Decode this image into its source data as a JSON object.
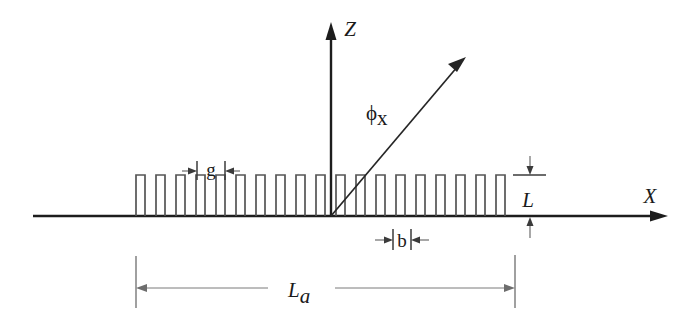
{
  "figure": {
    "title_alt": "Corrugated grating antenna cross-section diagram",
    "background_color": "#ffffff",
    "ink_color": "#1d1d1d",
    "tooth_color": "#555555",
    "dim_color": "#6d6d6d"
  },
  "axes": {
    "x": {
      "label": "X",
      "start_x": 33,
      "end_x": 668,
      "y": 216
    },
    "z": {
      "label": "Z",
      "x": 331,
      "start_y": 216,
      "end_y": 22
    }
  },
  "ray": {
    "label": "ϕ",
    "subscript": "x",
    "origin_x": 331,
    "origin_y": 216,
    "tip_x": 466,
    "tip_y": 57,
    "label_x": 366,
    "label_y": 120
  },
  "grating": {
    "tooth_count": 19,
    "pitch": 20,
    "tooth_width": 9,
    "tooth_height": 41,
    "first_tooth_left": 136,
    "baseline_y": 216,
    "top_y": 175
  },
  "dimensions": [
    {
      "name": "gap",
      "label": "g",
      "label_x": 211,
      "label_y": 176,
      "left_tick_x": 197,
      "right_tick_x": 225,
      "tick_top": 162,
      "tick_bottom": 180,
      "arrow_y": 171,
      "arrow_left_start": 182,
      "arrow_right_start": 240
    },
    {
      "name": "tooth-width",
      "label": "b",
      "label_x": 402,
      "label_y": 246,
      "left_tick_x": 393,
      "right_tick_x": 411,
      "tick_top": 230,
      "tick_bottom": 250,
      "arrow_y": 240,
      "arrow_left_start": 378,
      "arrow_right_start": 426
    },
    {
      "name": "tooth-depth",
      "label": "L",
      "label_x": 528,
      "label_y": 206,
      "top_tick_y": 175,
      "bottom_tick_y": 216,
      "tick_x_left": 515,
      "tick_x_right": 545,
      "arrow_x": 530,
      "arrow_top_start": 156,
      "arrow_bottom_start": 238
    },
    {
      "name": "aperture-length",
      "label": "L",
      "subscript": "a",
      "label_x": 300,
      "label_y": 296,
      "left_ext_x": 136,
      "right_ext_x": 515,
      "ext_top_y": 256,
      "ext_bottom_y": 307,
      "arrow_y": 288
    }
  ]
}
